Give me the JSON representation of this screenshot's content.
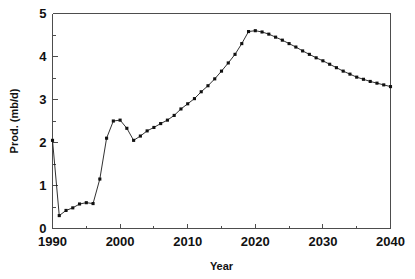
{
  "chart_data": {
    "type": "line",
    "title": "",
    "xlabel": "Year",
    "ylabel": "Prod. (mb/d)",
    "xlim": [
      1990,
      2040
    ],
    "ylim": [
      0,
      5
    ],
    "grid": false,
    "legend": "none",
    "x_major_ticks": [
      1990,
      2000,
      2010,
      2020,
      2030,
      2040
    ],
    "x_tick_labels": [
      "1990",
      "2000",
      "2010",
      "2020",
      "2030",
      "2040"
    ],
    "x_minor_interval": 5,
    "y_major_ticks": [
      0,
      1,
      2,
      3,
      4,
      5
    ],
    "y_tick_labels": [
      "0",
      "1",
      "2",
      "3",
      "4",
      "5"
    ],
    "y_minor_interval": 0.5,
    "marker": "square",
    "x": [
      1990,
      1991,
      1992,
      1993,
      1994,
      1995,
      1996,
      1997,
      1998,
      1999,
      2000,
      2001,
      2002,
      2003,
      2004,
      2005,
      2006,
      2007,
      2008,
      2009,
      2010,
      2011,
      2012,
      2013,
      2014,
      2015,
      2016,
      2017,
      2018,
      2019,
      2020,
      2021,
      2022,
      2023,
      2024,
      2025,
      2026,
      2027,
      2028,
      2029,
      2030,
      2031,
      2032,
      2033,
      2034,
      2035,
      2036,
      2037,
      2038,
      2039,
      2040
    ],
    "values": [
      2.05,
      0.3,
      0.42,
      0.48,
      0.57,
      0.6,
      0.58,
      1.15,
      2.1,
      2.5,
      2.52,
      2.33,
      2.05,
      2.15,
      2.27,
      2.35,
      2.44,
      2.52,
      2.63,
      2.78,
      2.9,
      3.02,
      3.18,
      3.32,
      3.48,
      3.66,
      3.85,
      4.05,
      4.3,
      4.58,
      4.6,
      4.57,
      4.52,
      4.45,
      4.38,
      4.3,
      4.22,
      4.13,
      4.05,
      3.97,
      3.9,
      3.82,
      3.74,
      3.66,
      3.59,
      3.52,
      3.47,
      3.42,
      3.38,
      3.34,
      3.3
    ],
    "series": [
      {
        "name": "Production",
        "values": [
          2.05,
          0.3,
          0.42,
          0.48,
          0.57,
          0.6,
          0.58,
          1.15,
          2.1,
          2.5,
          2.52,
          2.33,
          2.05,
          2.15,
          2.27,
          2.35,
          2.44,
          2.52,
          2.63,
          2.78,
          2.9,
          3.02,
          3.18,
          3.32,
          3.48,
          3.66,
          3.85,
          4.05,
          4.3,
          4.58,
          4.6,
          4.57,
          4.52,
          4.45,
          4.38,
          4.3,
          4.22,
          4.13,
          4.05,
          3.97,
          3.9,
          3.82,
          3.74,
          3.66,
          3.59,
          3.52,
          3.47,
          3.42,
          3.38,
          3.34,
          3.3
        ]
      }
    ],
    "colors": {
      "line": "#1a1a1a",
      "marker": "#111111",
      "axis": "#4d4d4d",
      "background": "#ffffff"
    }
  }
}
